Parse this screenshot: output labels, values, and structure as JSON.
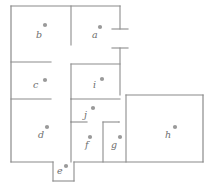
{
  "diagram": {
    "type": "floor-plan",
    "title": "Floor plan with labelled rooms",
    "canvas": {
      "width": 215,
      "height": 187
    },
    "style": {
      "background": "#ffffff",
      "wall_color": "#8c8c8c",
      "dot_color": "#9a9a9a",
      "label_color": "#6e6e6e"
    },
    "rooms": [
      {
        "id": "a",
        "label": "a",
        "label_x": 92,
        "label_y": 38,
        "dot_x": 100,
        "dot_y": 27
      },
      {
        "id": "b",
        "label": "b",
        "label_x": 36,
        "label_y": 38,
        "dot_x": 45,
        "dot_y": 25
      },
      {
        "id": "c",
        "label": "c",
        "label_x": 33,
        "label_y": 88,
        "dot_x": 45,
        "dot_y": 80
      },
      {
        "id": "d",
        "label": "d",
        "label_x": 38,
        "label_y": 138,
        "dot_x": 47,
        "dot_y": 127
      },
      {
        "id": "e",
        "label": "e",
        "label_x": 57,
        "label_y": 174,
        "dot_x": 66,
        "dot_y": 166
      },
      {
        "id": "f",
        "label": "f",
        "label_x": 85,
        "label_y": 148,
        "dot_x": 90,
        "dot_y": 137
      },
      {
        "id": "g",
        "label": "g",
        "label_x": 111,
        "label_y": 148,
        "dot_x": 120,
        "dot_y": 137
      },
      {
        "id": "h",
        "label": "h",
        "label_x": 165,
        "label_y": 138,
        "dot_x": 175,
        "dot_y": 127
      },
      {
        "id": "i",
        "label": "i",
        "label_x": 93,
        "label_y": 88,
        "dot_x": 102,
        "dot_y": 79
      },
      {
        "id": "j",
        "label": "j",
        "label_x": 84,
        "label_y": 118,
        "dot_x": 93,
        "dot_y": 108
      }
    ],
    "walls": [
      {
        "name": "outer-top-left-run",
        "d": "M 11 6 L 120 6"
      },
      {
        "name": "outer-left-edge",
        "d": "M 11 6 L 11 162"
      },
      {
        "name": "outer-bottom-left-run",
        "d": "M 11 162 L 53 162"
      },
      {
        "name": "room-e-left",
        "d": "M 53 162 L 53 181"
      },
      {
        "name": "room-e-bottom",
        "d": "M 53 181 L 74 181"
      },
      {
        "name": "room-e-right",
        "d": "M 74 181 L 74 162"
      },
      {
        "name": "outer-bottom-right-run",
        "d": "M 74 162 L 203 162"
      },
      {
        "name": "outer-right-edge",
        "d": "M 203 162 L 203 95"
      },
      {
        "name": "outer-top-right-run",
        "d": "M 203 95 L 126 95"
      },
      {
        "name": "partition-b-a-vertical",
        "d": "M 71 6 L 71 45"
      },
      {
        "name": "partition-top-right-vertical",
        "d": "M 120 6 L 120 29"
      },
      {
        "name": "door-stub-upper-right",
        "d": "M 112 29 L 128 29"
      },
      {
        "name": "door-stub-mid-right",
        "d": "M 112 48 L 128 48"
      },
      {
        "name": "partition-mid-right-vertical",
        "d": "M 120 48 L 120 95"
      },
      {
        "name": "partition-c-top",
        "d": "M 11 62 L 51 62"
      },
      {
        "name": "partition-c-bottom",
        "d": "M 11 99 L 51 99"
      },
      {
        "name": "room-i-top",
        "d": "M 71 64 L 120 64"
      },
      {
        "name": "room-i-left",
        "d": "M 71 64 L 71 99"
      },
      {
        "name": "room-i-bottom",
        "d": "M 71 99 L 120 99"
      },
      {
        "name": "partition-j-left",
        "d": "M 71 99 L 71 122"
      },
      {
        "name": "partition-j-bottom",
        "d": "M 71 122 L 87 122"
      },
      {
        "name": "partition-fg-top-left",
        "d": "M 71 122 L 71 162"
      },
      {
        "name": "partition-fg-divider-top",
        "d": "M 103 122 L 119 122"
      },
      {
        "name": "partition-fg-divider",
        "d": "M 103 122 L 103 162"
      },
      {
        "name": "partition-h-left",
        "d": "M 126 95 L 126 162"
      },
      {
        "name": "door-stub-h-left",
        "d": "M 119 122 L 119 122"
      }
    ]
  }
}
